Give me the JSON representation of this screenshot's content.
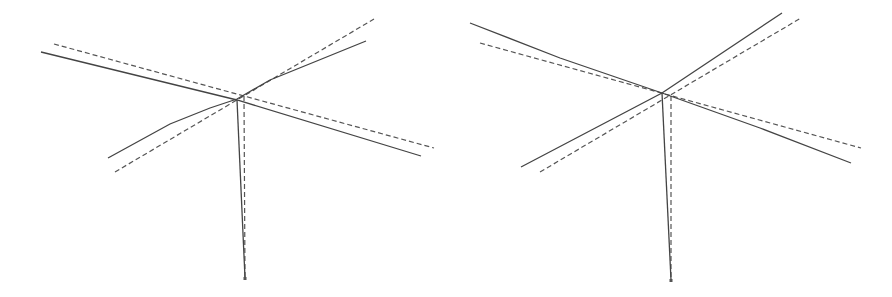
{
  "figure": {
    "colors": {
      "solid": "#444444",
      "dashed": "#555555",
      "background": "#ffffff"
    },
    "panels": [
      {
        "id": "left",
        "solid": {
          "long_arm": [
            [
              41,
              52
            ],
            [
              237,
              100
            ],
            [
              421,
              156
            ]
          ],
          "short_arm": [
            [
              108,
              158
            ],
            [
              170,
              124
            ],
            [
              210,
              108
            ],
            [
              237,
              99
            ],
            [
              270,
              80
            ],
            [
              366,
              41
            ]
          ],
          "post": [
            [
              237,
              100
            ],
            [
              245,
              278
            ]
          ]
        },
        "dashed": {
          "long_arm": [
            [
              54,
              44
            ],
            [
              434,
              148
            ]
          ],
          "short_arm": [
            [
              115,
              172
            ],
            [
              374,
              19
            ]
          ],
          "post": [
            [
              244,
              96
            ],
            [
              245,
              278
            ]
          ]
        },
        "base": [
          245,
          279
        ]
      },
      {
        "id": "right",
        "solid": {
          "long_arm": [
            [
              470,
              23
            ],
            [
              560,
              58
            ],
            [
              662,
              93
            ],
            [
              760,
              128
            ],
            [
              851,
              163
            ]
          ],
          "short_arm": [
            [
              521,
              167
            ],
            [
              662,
              93
            ],
            [
              782,
              13
            ]
          ],
          "post": [
            [
              662,
              93
            ],
            [
              671,
              280
            ]
          ]
        },
        "dashed": {
          "long_arm": [
            [
              480,
              43
            ],
            [
              861,
              148
            ]
          ],
          "short_arm": [
            [
              540,
              172
            ],
            [
              801,
              18
            ]
          ],
          "post": [
            [
              671,
              96
            ],
            [
              671,
              280
            ]
          ]
        },
        "base": [
          671,
          281
        ]
      }
    ]
  }
}
